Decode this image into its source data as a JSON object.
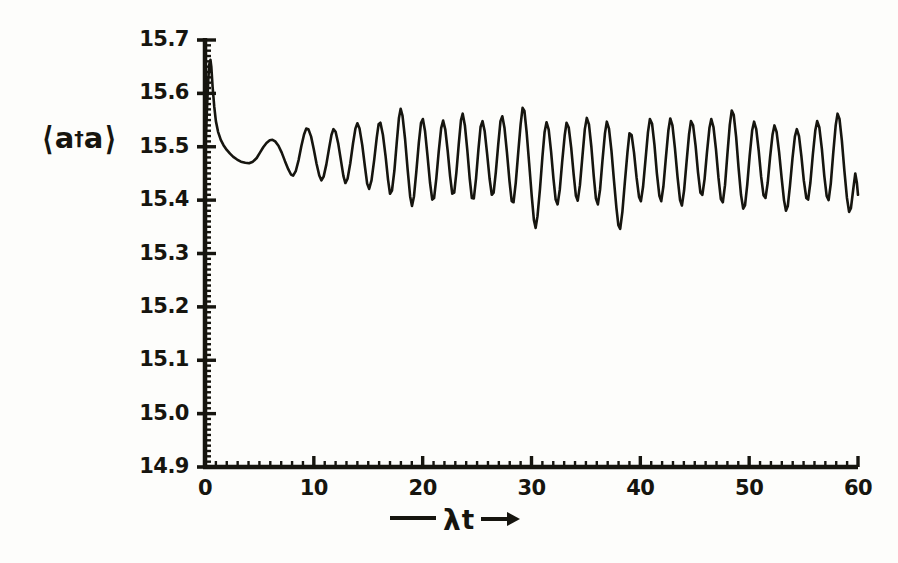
{
  "chart_data": {
    "type": "line",
    "title": "",
    "subtitle": "",
    "xlabel": "—— λt →",
    "xlabel_parts": {
      "dash": "——",
      "symbol": "λt",
      "arrow": "→"
    },
    "ylabel": "⟨a†a⟩",
    "ylabel_parts": {
      "bra": "⟨",
      "base": "a",
      "dagger": "†",
      "operator": "a",
      "ket": "⟩"
    },
    "xlim": [
      0,
      60
    ],
    "ylim": [
      14.9,
      15.7
    ],
    "xticks": [
      0,
      10,
      20,
      30,
      40,
      50,
      60
    ],
    "xtick_labels": [
      "0",
      "10",
      "20",
      "30",
      "40",
      "50",
      "60"
    ],
    "yticks": [
      14.9,
      15.0,
      15.1,
      15.2,
      15.3,
      15.4,
      15.5,
      15.6,
      15.7
    ],
    "ytick_labels": [
      "14.9",
      "15.0",
      "15.1",
      "15.2",
      "15.3",
      "15.4",
      "15.5",
      "15.6",
      "15.7"
    ],
    "x_minor_tick_step": 1,
    "y_minor_tick_step": 0.01,
    "grid": false,
    "legend": null,
    "line_color": "#16150f",
    "line_width": 2.6,
    "axis_color": "#16150f",
    "background": "#fdfdfb",
    "series": [
      {
        "name": "photon number expectation",
        "points": [
          [
            0.0,
            15.5
          ],
          [
            0.1,
            15.53
          ],
          [
            0.2,
            15.58
          ],
          [
            0.3,
            15.625
          ],
          [
            0.4,
            15.655
          ],
          [
            0.5,
            15.663
          ],
          [
            0.58,
            15.65
          ],
          [
            0.7,
            15.612
          ],
          [
            0.85,
            15.575
          ],
          [
            1.0,
            15.548
          ],
          [
            1.2,
            15.528
          ],
          [
            1.45,
            15.513
          ],
          [
            1.7,
            15.503
          ],
          [
            2.0,
            15.494
          ],
          [
            2.3,
            15.487
          ],
          [
            2.6,
            15.481
          ],
          [
            2.95,
            15.476
          ],
          [
            3.3,
            15.472
          ],
          [
            3.7,
            15.47
          ],
          [
            4.05,
            15.469
          ],
          [
            4.4,
            15.472
          ],
          [
            4.75,
            15.479
          ],
          [
            5.05,
            15.489
          ],
          [
            5.35,
            15.499
          ],
          [
            5.65,
            15.507
          ],
          [
            5.95,
            15.512
          ],
          [
            6.2,
            15.513
          ],
          [
            6.45,
            15.51
          ],
          [
            6.75,
            15.502
          ],
          [
            7.05,
            15.489
          ],
          [
            7.35,
            15.473
          ],
          [
            7.65,
            15.458
          ],
          [
            7.9,
            15.448
          ],
          [
            8.1,
            15.446
          ],
          [
            8.35,
            15.455
          ],
          [
            8.6,
            15.475
          ],
          [
            8.85,
            15.501
          ],
          [
            9.1,
            15.523
          ],
          [
            9.3,
            15.534
          ],
          [
            9.5,
            15.533
          ],
          [
            9.75,
            15.519
          ],
          [
            10.0,
            15.495
          ],
          [
            10.25,
            15.468
          ],
          [
            10.5,
            15.446
          ],
          [
            10.7,
            15.437
          ],
          [
            10.9,
            15.444
          ],
          [
            11.15,
            15.467
          ],
          [
            11.4,
            15.497
          ],
          [
            11.62,
            15.522
          ],
          [
            11.8,
            15.533
          ],
          [
            12.0,
            15.528
          ],
          [
            12.25,
            15.505
          ],
          [
            12.5,
            15.473
          ],
          [
            12.72,
            15.445
          ],
          [
            12.9,
            15.432
          ],
          [
            13.1,
            15.44
          ],
          [
            13.35,
            15.469
          ],
          [
            13.6,
            15.506
          ],
          [
            13.82,
            15.534
          ],
          [
            14.0,
            15.544
          ],
          [
            14.2,
            15.534
          ],
          [
            14.45,
            15.503
          ],
          [
            14.7,
            15.462
          ],
          [
            14.9,
            15.431
          ],
          [
            15.08,
            15.421
          ],
          [
            15.3,
            15.437
          ],
          [
            15.55,
            15.476
          ],
          [
            15.78,
            15.517
          ],
          [
            15.95,
            15.542
          ],
          [
            16.12,
            15.545
          ],
          [
            16.35,
            15.522
          ],
          [
            16.6,
            15.481
          ],
          [
            16.82,
            15.438
          ],
          [
            17.0,
            15.412
          ],
          [
            17.18,
            15.418
          ],
          [
            17.4,
            15.455
          ],
          [
            17.62,
            15.508
          ],
          [
            17.82,
            15.554
          ],
          [
            17.98,
            15.571
          ],
          [
            18.15,
            15.558
          ],
          [
            18.38,
            15.515
          ],
          [
            18.62,
            15.457
          ],
          [
            18.85,
            15.407
          ],
          [
            19.02,
            15.389
          ],
          [
            19.2,
            15.407
          ],
          [
            19.42,
            15.454
          ],
          [
            19.65,
            15.508
          ],
          [
            19.85,
            15.545
          ],
          [
            20.02,
            15.552
          ],
          [
            20.22,
            15.529
          ],
          [
            20.45,
            15.482
          ],
          [
            20.68,
            15.432
          ],
          [
            20.88,
            15.401
          ],
          [
            21.05,
            15.404
          ],
          [
            21.25,
            15.44
          ],
          [
            21.48,
            15.492
          ],
          [
            21.7,
            15.535
          ],
          [
            21.88,
            15.549
          ],
          [
            22.08,
            15.532
          ],
          [
            22.3,
            15.492
          ],
          [
            22.52,
            15.445
          ],
          [
            22.72,
            15.412
          ],
          [
            22.9,
            15.414
          ],
          [
            23.1,
            15.452
          ],
          [
            23.32,
            15.506
          ],
          [
            23.52,
            15.55
          ],
          [
            23.68,
            15.562
          ],
          [
            23.88,
            15.54
          ],
          [
            24.1,
            15.494
          ],
          [
            24.32,
            15.441
          ],
          [
            24.52,
            15.404
          ],
          [
            24.7,
            15.403
          ],
          [
            24.9,
            15.44
          ],
          [
            25.12,
            15.494
          ],
          [
            25.32,
            15.537
          ],
          [
            25.5,
            15.548
          ],
          [
            25.7,
            15.529
          ],
          [
            25.92,
            15.487
          ],
          [
            26.15,
            15.44
          ],
          [
            26.35,
            15.41
          ],
          [
            26.52,
            15.414
          ],
          [
            26.72,
            15.452
          ],
          [
            26.95,
            15.506
          ],
          [
            27.15,
            15.548
          ],
          [
            27.32,
            15.557
          ],
          [
            27.52,
            15.535
          ],
          [
            27.75,
            15.488
          ],
          [
            27.98,
            15.435
          ],
          [
            28.18,
            15.398
          ],
          [
            28.35,
            15.396
          ],
          [
            28.55,
            15.432
          ],
          [
            28.78,
            15.489
          ],
          [
            29.0,
            15.542
          ],
          [
            29.18,
            15.573
          ],
          [
            29.35,
            15.567
          ],
          [
            29.55,
            15.528
          ],
          [
            29.78,
            15.47
          ],
          [
            30.02,
            15.408
          ],
          [
            30.22,
            15.363
          ],
          [
            30.38,
            15.348
          ],
          [
            30.55,
            15.37
          ],
          [
            30.78,
            15.421
          ],
          [
            31.0,
            15.48
          ],
          [
            31.2,
            15.527
          ],
          [
            31.38,
            15.546
          ],
          [
            31.58,
            15.532
          ],
          [
            31.8,
            15.491
          ],
          [
            32.02,
            15.44
          ],
          [
            32.22,
            15.401
          ],
          [
            32.4,
            15.392
          ],
          [
            32.6,
            15.42
          ],
          [
            32.82,
            15.472
          ],
          [
            33.05,
            15.521
          ],
          [
            33.22,
            15.545
          ],
          [
            33.42,
            15.536
          ],
          [
            33.65,
            15.498
          ],
          [
            33.88,
            15.447
          ],
          [
            34.08,
            15.408
          ],
          [
            34.25,
            15.399
          ],
          [
            34.45,
            15.428
          ],
          [
            34.68,
            15.482
          ],
          [
            34.9,
            15.533
          ],
          [
            35.08,
            15.554
          ],
          [
            35.28,
            15.542
          ],
          [
            35.5,
            15.5
          ],
          [
            35.72,
            15.445
          ],
          [
            35.92,
            15.403
          ],
          [
            36.1,
            15.392
          ],
          [
            36.3,
            15.42
          ],
          [
            36.52,
            15.474
          ],
          [
            36.75,
            15.525
          ],
          [
            36.92,
            15.547
          ],
          [
            37.12,
            15.534
          ],
          [
            37.35,
            15.492
          ],
          [
            37.58,
            15.436
          ],
          [
            37.8,
            15.386
          ],
          [
            37.98,
            15.353
          ],
          [
            38.15,
            15.346
          ],
          [
            38.35,
            15.378
          ],
          [
            38.58,
            15.434
          ],
          [
            38.82,
            15.49
          ],
          [
            39.0,
            15.525
          ],
          [
            39.2,
            15.522
          ],
          [
            39.42,
            15.489
          ],
          [
            39.65,
            15.443
          ],
          [
            39.88,
            15.406
          ],
          [
            40.05,
            15.398
          ],
          [
            40.25,
            15.425
          ],
          [
            40.48,
            15.477
          ],
          [
            40.7,
            15.527
          ],
          [
            40.88,
            15.552
          ],
          [
            41.08,
            15.543
          ],
          [
            41.3,
            15.503
          ],
          [
            41.52,
            15.45
          ],
          [
            41.75,
            15.408
          ],
          [
            41.92,
            15.398
          ],
          [
            42.12,
            15.426
          ],
          [
            42.35,
            15.48
          ],
          [
            42.58,
            15.531
          ],
          [
            42.75,
            15.553
          ],
          [
            42.95,
            15.54
          ],
          [
            43.18,
            15.497
          ],
          [
            43.42,
            15.443
          ],
          [
            43.65,
            15.4
          ],
          [
            43.82,
            15.39
          ],
          [
            44.02,
            15.418
          ],
          [
            44.25,
            15.472
          ],
          [
            44.48,
            15.524
          ],
          [
            44.65,
            15.548
          ],
          [
            44.85,
            15.54
          ],
          [
            45.08,
            15.501
          ],
          [
            45.3,
            15.452
          ],
          [
            45.52,
            15.414
          ],
          [
            45.7,
            15.41
          ],
          [
            45.9,
            15.439
          ],
          [
            46.12,
            15.489
          ],
          [
            46.35,
            15.535
          ],
          [
            46.52,
            15.552
          ],
          [
            46.72,
            15.537
          ],
          [
            46.95,
            15.495
          ],
          [
            47.18,
            15.442
          ],
          [
            47.4,
            15.402
          ],
          [
            47.58,
            15.396
          ],
          [
            47.78,
            15.428
          ],
          [
            48.0,
            15.486
          ],
          [
            48.22,
            15.541
          ],
          [
            48.4,
            15.568
          ],
          [
            48.58,
            15.56
          ],
          [
            48.8,
            15.519
          ],
          [
            49.02,
            15.462
          ],
          [
            49.25,
            15.41
          ],
          [
            49.45,
            15.384
          ],
          [
            49.62,
            15.39
          ],
          [
            49.82,
            15.428
          ],
          [
            50.05,
            15.484
          ],
          [
            50.28,
            15.531
          ],
          [
            50.45,
            15.547
          ],
          [
            50.65,
            15.533
          ],
          [
            50.88,
            15.492
          ],
          [
            51.1,
            15.444
          ],
          [
            51.32,
            15.409
          ],
          [
            51.5,
            15.404
          ],
          [
            51.7,
            15.432
          ],
          [
            51.92,
            15.48
          ],
          [
            52.15,
            15.523
          ],
          [
            52.32,
            15.54
          ],
          [
            52.52,
            15.528
          ],
          [
            52.75,
            15.49
          ],
          [
            52.98,
            15.442
          ],
          [
            53.2,
            15.4
          ],
          [
            53.38,
            15.38
          ],
          [
            53.55,
            15.389
          ],
          [
            53.75,
            15.427
          ],
          [
            53.98,
            15.478
          ],
          [
            54.2,
            15.519
          ],
          [
            54.38,
            15.533
          ],
          [
            54.58,
            15.52
          ],
          [
            54.8,
            15.482
          ],
          [
            55.02,
            15.437
          ],
          [
            55.25,
            15.404
          ],
          [
            55.42,
            15.401
          ],
          [
            55.62,
            15.432
          ],
          [
            55.85,
            15.485
          ],
          [
            56.08,
            15.531
          ],
          [
            56.25,
            15.548
          ],
          [
            56.45,
            15.536
          ],
          [
            56.68,
            15.496
          ],
          [
            56.9,
            15.446
          ],
          [
            57.12,
            15.408
          ],
          [
            57.3,
            15.4
          ],
          [
            57.5,
            15.431
          ],
          [
            57.72,
            15.487
          ],
          [
            57.95,
            15.54
          ],
          [
            58.12,
            15.562
          ],
          [
            58.3,
            15.552
          ],
          [
            58.52,
            15.511
          ],
          [
            58.75,
            15.455
          ],
          [
            58.98,
            15.405
          ],
          [
            59.18,
            15.378
          ],
          [
            59.35,
            15.385
          ],
          [
            59.55,
            15.418
          ],
          [
            59.75,
            15.45
          ],
          [
            59.9,
            15.432
          ],
          [
            60.0,
            15.41
          ]
        ]
      }
    ],
    "annotations": [],
    "description_values": {
      "initial_value": 15.5,
      "initial_peak": 15.663,
      "collapse_minimum": 15.469,
      "global_max": 15.663,
      "global_min": 15.346,
      "final_value": 15.41
    }
  },
  "axes": {
    "y_axis_name": "photon-number-axis",
    "x_axis_name": "scaled-time-axis"
  }
}
